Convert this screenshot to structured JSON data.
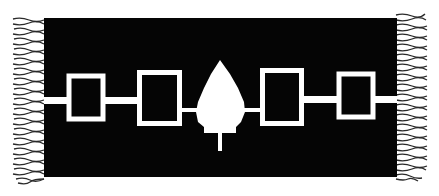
{
  "image": {
    "subject": "Woven belt with Hiawatha wampum design",
    "colors": {
      "background": "#ffffff",
      "belt": "#050505",
      "motif": "#ffffff",
      "fringe": "#2a2a2a"
    },
    "elements": [
      "left-fringe",
      "square-1",
      "square-2",
      "central-tree",
      "square-3",
      "square-4",
      "right-fringe",
      "connecting-line"
    ]
  }
}
